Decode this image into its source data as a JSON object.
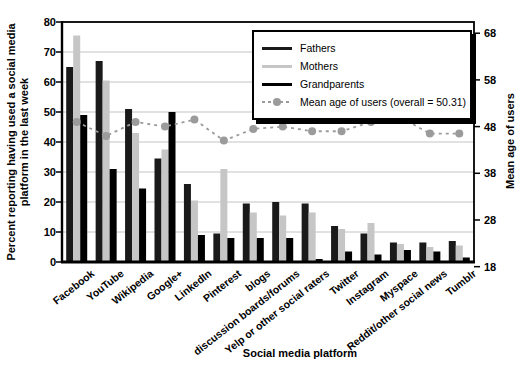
{
  "labels": {
    "ylabel_left_l1": "Percent reporting having used a social media",
    "ylabel_left_l2": "platform in the last week",
    "ylabel_right": "Mean age of users",
    "xlabel": "Social media platform"
  },
  "chart_data": {
    "type": "bar",
    "title": "",
    "xlabel": "Social media platform",
    "grid": "horizontal",
    "legend_position": "top-right",
    "categories": [
      "Facebook",
      "YouTube",
      "Wikipedia",
      "Google+",
      "LinkedIn",
      "Pinterest",
      "blogs",
      "discussion boards/forums",
      "Yelp or other social raters",
      "Twitter",
      "Instagram",
      "Myspace",
      "Reddit/other social news",
      "Tumblr"
    ],
    "series": [
      {
        "name": "Fathers",
        "color": "#1a1a1a",
        "values": [
          65,
          67,
          51,
          34.5,
          26,
          9.5,
          19.5,
          20,
          19.5,
          12,
          9.5,
          6.5,
          6.5,
          7
        ]
      },
      {
        "name": "Mothers",
        "color": "#c6c6c6",
        "values": [
          75.5,
          60.5,
          43,
          37.5,
          20.5,
          31,
          16.5,
          15.5,
          16.5,
          11,
          13,
          6,
          5,
          5.5
        ]
      },
      {
        "name": "Grandparents",
        "color": "#000000",
        "values": [
          49,
          31,
          24.5,
          50,
          9,
          8,
          8,
          8,
          1,
          3.5,
          2.5,
          4,
          3.5,
          1.5
        ]
      }
    ],
    "line_series": {
      "name": "Mean age of users (overall = 50.31)",
      "color": "#9b9b9b",
      "dashed": true,
      "marker": "circle",
      "axis": "right",
      "values": [
        49,
        46,
        49,
        48,
        49.5,
        45,
        47.5,
        48,
        47,
        47,
        49,
        50,
        46.5,
        46.5
      ]
    },
    "left_axis": {
      "label": "Percent reporting having used a social media platform in the last week",
      "ticks": [
        0,
        10,
        20,
        30,
        40,
        50,
        60,
        70,
        80
      ],
      "range": [
        0,
        80
      ]
    },
    "right_axis": {
      "label": "Mean age of users",
      "ticks": [
        18,
        28,
        38,
        48,
        58,
        68
      ],
      "range": [
        19,
        70.4
      ]
    }
  }
}
